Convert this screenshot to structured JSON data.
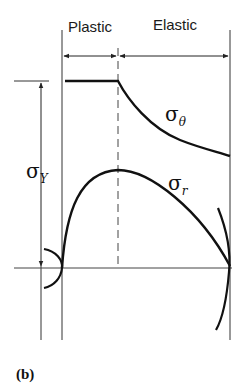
{
  "figure": {
    "caption": "(b)",
    "regions": [
      {
        "label": "Plastic"
      },
      {
        "label": "Elastic"
      }
    ],
    "curves": {
      "hoop_stress": {
        "symbol": "σ",
        "subscript": "θ"
      },
      "radial_stress": {
        "symbol": "σ",
        "subscript": "r"
      }
    },
    "yield_stress": {
      "symbol": "σ",
      "subscript": "Y"
    },
    "colors": {
      "line": "#111111",
      "thin_line": "#333333",
      "background": "#ffffff"
    }
  }
}
